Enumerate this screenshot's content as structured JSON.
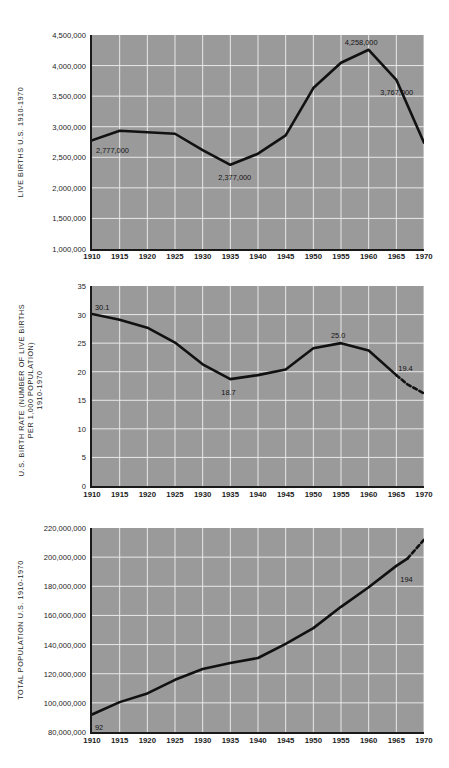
{
  "figure": {
    "background": "#ffffff",
    "plot_background": "#9a9a9a",
    "grid_color": "#e8e8e8",
    "line_color": "#111111",
    "axis_color": "#1a1a1a"
  },
  "chart_data": [
    {
      "id": "live-births",
      "type": "line",
      "title": "",
      "ylabel": "LIVE BIRTHS U.S. 1910-1970",
      "xlabel": "",
      "grid": true,
      "legend": "none",
      "xlim": [
        1910,
        1970
      ],
      "ylim": [
        1000000,
        4500000
      ],
      "xticks": [
        1910,
        1915,
        1920,
        1925,
        1930,
        1935,
        1940,
        1945,
        1950,
        1955,
        1960,
        1965,
        1970
      ],
      "xticklabels": [
        "1910",
        "1915",
        "1920",
        "1925",
        "1930",
        "1935",
        "1940",
        "1945",
        "1950",
        "1955",
        "1960",
        "1965",
        "1970"
      ],
      "yticks": [
        1000000,
        1500000,
        2000000,
        2500000,
        3000000,
        3500000,
        4000000,
        4500000
      ],
      "yticklabels": [
        "1,000,000",
        "1,500,000",
        "2,000,000",
        "2,500,000",
        "3,000,000",
        "3,500,000",
        "4,000,000",
        "4,500,000"
      ],
      "x": [
        1910,
        1915,
        1920,
        1925,
        1930,
        1935,
        1940,
        1945,
        1950,
        1955,
        1960,
        1965,
        1970
      ],
      "values": [
        2777000,
        2935000,
        2910000,
        2885000,
        2618000,
        2377000,
        2559000,
        2858000,
        3632000,
        4047000,
        4258000,
        3767000,
        2739000
      ],
      "annotations": [
        {
          "label": "2,777,000",
          "x": 1910,
          "y": 2777000
        },
        {
          "label": "2,377,000",
          "x": 1935,
          "y": 2377000
        },
        {
          "label": "4,258,000",
          "x": 1960,
          "y": 4258000
        },
        {
          "label": "3,767,000",
          "x": 1965,
          "y": 3767000
        }
      ]
    },
    {
      "id": "birth-rate",
      "type": "line",
      "title": "",
      "ylabel_line1": "U.S. BIRTH RATE (NUMBER OF LIVE BIRTHS",
      "ylabel_line2": "PER 1,000 POPULATION)",
      "ylabel_line3": "1910-1970",
      "xlabel": "",
      "grid": true,
      "legend": "none",
      "xlim": [
        1910,
        1970
      ],
      "ylim": [
        0,
        35
      ],
      "xticks": [
        1910,
        1915,
        1920,
        1925,
        1930,
        1935,
        1940,
        1945,
        1950,
        1955,
        1960,
        1965,
        1970
      ],
      "xticklabels": [
        "1910",
        "1915",
        "1920",
        "1925",
        "1930",
        "1935",
        "1940",
        "1945",
        "1950",
        "1955",
        "1960",
        "1965",
        "1970"
      ],
      "yticks": [
        0,
        5,
        10,
        15,
        20,
        25,
        30,
        35
      ],
      "yticklabels": [
        "0",
        "5",
        "10",
        "15",
        "20",
        "25",
        "30",
        "35"
      ],
      "x": [
        1910,
        1915,
        1920,
        1925,
        1930,
        1935,
        1940,
        1945,
        1950,
        1955,
        1960,
        1965,
        1967,
        1970
      ],
      "values": [
        30.1,
        29.1,
        27.7,
        25.1,
        21.3,
        18.7,
        19.4,
        20.4,
        24.1,
        25.0,
        23.7,
        19.4,
        17.8,
        16.2
      ],
      "dashed_from_index": 11,
      "annotations": [
        {
          "label": "30.1",
          "x": 1910,
          "y": 30.1
        },
        {
          "label": "18.7",
          "x": 1935,
          "y": 18.7
        },
        {
          "label": "25.0",
          "x": 1955,
          "y": 25.0
        },
        {
          "label": "19.4",
          "x": 1965,
          "y": 19.4
        }
      ]
    },
    {
      "id": "total-population",
      "type": "line",
      "title": "",
      "ylabel": "TOTAL POPULATION  U.S. 1910-1970",
      "xlabel": "",
      "grid": true,
      "legend": "none",
      "xlim": [
        1910,
        1970
      ],
      "ylim": [
        80000000,
        220000000
      ],
      "xticks": [
        1910,
        1915,
        1920,
        1925,
        1930,
        1935,
        1940,
        1945,
        1950,
        1955,
        1960,
        1965,
        1970
      ],
      "xticklabels": [
        "1910",
        "1915",
        "1920",
        "1925",
        "1930",
        "1935",
        "1940",
        "1945",
        "1950",
        "1955",
        "1960",
        "1965",
        "1970"
      ],
      "yticks": [
        80000000,
        100000000,
        120000000,
        140000000,
        160000000,
        180000000,
        200000000,
        220000000
      ],
      "yticklabels": [
        "80,000,000",
        "100,000,000",
        "120,000,000",
        "140,000,000",
        "160,000,000",
        "180,000,000",
        "200,000,000",
        "220,000,000"
      ],
      "x": [
        1910,
        1915,
        1920,
        1925,
        1930,
        1935,
        1940,
        1945,
        1950,
        1955,
        1960,
        1965,
        1967,
        1970
      ],
      "values": [
        92000000,
        100500000,
        106500000,
        115800000,
        123200000,
        127300000,
        130800000,
        140500000,
        151300000,
        165900000,
        179300000,
        194000000,
        199000000,
        212000000
      ],
      "dashed_from_index": 12,
      "annotations": [
        {
          "label": "92",
          "x": 1910,
          "y": 92000000
        },
        {
          "label": "194",
          "x": 1965,
          "y": 194000000
        }
      ]
    }
  ]
}
